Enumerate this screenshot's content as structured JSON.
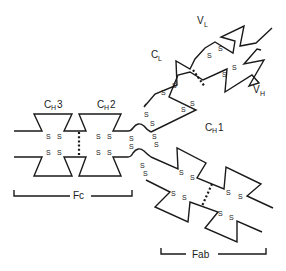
{
  "labels": {
    "ch3": {
      "main": "C",
      "sub": "H",
      "num": "3"
    },
    "ch2": {
      "main": "C",
      "sub": "H",
      "num": "2"
    },
    "ch1": {
      "main": "C",
      "sub": "H",
      "num": "1"
    },
    "cl": {
      "main": "C",
      "sub": "L"
    },
    "vl": {
      "main": "V",
      "sub": "L"
    },
    "vh": {
      "main": "V",
      "sub": "H"
    },
    "fc": "Fc",
    "fab": "Fab"
  },
  "disulfide_glyph": "S",
  "colors": {
    "line": "#1a1a1a",
    "background": "#ffffff"
  }
}
